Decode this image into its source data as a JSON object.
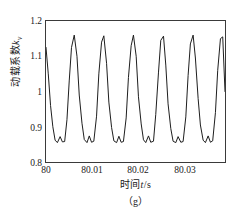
{
  "figure": {
    "caption": "（g）"
  },
  "axes": {
    "ylabel_main": "动载系数",
    "ylabel_symbol": "k",
    "ylabel_subscript": "v",
    "xlabel_prefix": "时间",
    "xlabel_symbol": "t",
    "xlabel_suffix": "/s",
    "yticks": [
      "1.2",
      "1.1",
      "1",
      "0.9",
      "0.8"
    ],
    "xticks": [
      "80",
      "80.01",
      "80.02",
      "80.03"
    ]
  },
  "chart_data": {
    "type": "line",
    "title": "",
    "subtitle": "",
    "caption": "（g）",
    "xlabel": "时间t/s",
    "ylabel": "动载系数kv",
    "xlim": [
      80.0,
      80.0393
    ],
    "ylim": [
      0.8,
      1.2
    ],
    "xticks": [
      80.0,
      80.01,
      80.02,
      80.03
    ],
    "xticklabels": [
      "80",
      "80.01",
      "80.02",
      "80.03"
    ],
    "yticks": [
      0.8,
      0.9,
      1.0,
      1.1,
      1.2
    ],
    "yticklabels": [
      "0.8",
      "0.9",
      "1",
      "0.9",
      "1.2"
    ],
    "grid": false,
    "legend": null,
    "line_color": "#1a1a1a",
    "line_width": 1.0,
    "period_s": 0.00545,
    "peak_value": 1.16,
    "trough_value": 0.855,
    "trough_bump_value": 0.878,
    "n_peaks_visible": 8,
    "series": [
      {
        "name": "动载系数kv",
        "x": [
          80.0,
          80.0005,
          80.001,
          80.0015,
          80.002,
          80.0025,
          80.0031,
          80.0036,
          80.0041,
          80.0046,
          80.0051,
          80.0056,
          80.0062,
          80.0068,
          80.0073,
          80.0079,
          80.0084,
          80.009,
          80.0095,
          80.01,
          80.0105,
          80.0111,
          80.0116,
          80.0122,
          80.0127,
          80.0133,
          80.0138,
          80.0144,
          80.0149,
          80.0155,
          80.016,
          80.0165,
          80.017,
          80.0176,
          80.0181,
          80.0187,
          80.0192,
          80.0198,
          80.0203,
          80.0209,
          80.0214,
          80.0219,
          80.0225,
          80.023,
          80.0236,
          80.0241,
          80.0247,
          80.0252,
          80.0258,
          80.0263,
          80.0268,
          80.0274,
          80.0279,
          80.0285,
          80.029,
          80.0296,
          80.0301,
          80.0307,
          80.0312,
          80.0317,
          80.0323,
          80.0328,
          80.0334,
          80.0339,
          80.0345,
          80.035,
          80.0356,
          80.0361,
          80.0366,
          80.0372,
          80.0377,
          80.0383,
          80.0388,
          80.0393
        ],
        "y": [
          1.125,
          1.05,
          0.96,
          0.9,
          0.862,
          0.855,
          0.872,
          0.857,
          0.858,
          0.92,
          1.03,
          1.125,
          1.16,
          1.1,
          0.99,
          0.91,
          0.864,
          0.855,
          0.874,
          0.856,
          0.859,
          0.93,
          1.05,
          1.14,
          1.158,
          1.08,
          0.97,
          0.898,
          0.86,
          0.855,
          0.873,
          0.856,
          0.858,
          0.925,
          1.04,
          1.13,
          1.16,
          1.1,
          0.985,
          0.908,
          0.863,
          0.855,
          0.874,
          0.856,
          0.859,
          0.935,
          1.055,
          1.145,
          1.157,
          1.075,
          0.965,
          0.895,
          0.859,
          0.855,
          0.872,
          0.856,
          0.858,
          0.928,
          1.045,
          1.135,
          1.16,
          1.095,
          0.98,
          0.905,
          0.862,
          0.855,
          0.874,
          0.856,
          0.86,
          0.94,
          1.06,
          1.15,
          1.155,
          1.0
        ]
      }
    ]
  }
}
